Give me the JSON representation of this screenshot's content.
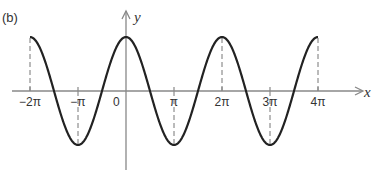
{
  "figure_label": "(b)",
  "axes": {
    "x_label": "x",
    "y_label": "y",
    "origin_label": "0",
    "ticks": [
      {
        "value": -2,
        "label": "−2π"
      },
      {
        "value": -1,
        "label": "−π"
      },
      {
        "value": 1,
        "label": "π"
      },
      {
        "value": 2,
        "label": "2π"
      },
      {
        "value": 3,
        "label": "3π"
      },
      {
        "value": 4,
        "label": "4π"
      }
    ]
  },
  "curve": {
    "function": "y = cos(x)",
    "domain_pi": [
      -2,
      4
    ],
    "color": "#222222"
  },
  "dashed_guides_at_pi": [
    -2,
    -1,
    1,
    2,
    3,
    4
  ],
  "colors": {
    "axis": "#888888",
    "curve": "#222222",
    "text": "#333333"
  }
}
